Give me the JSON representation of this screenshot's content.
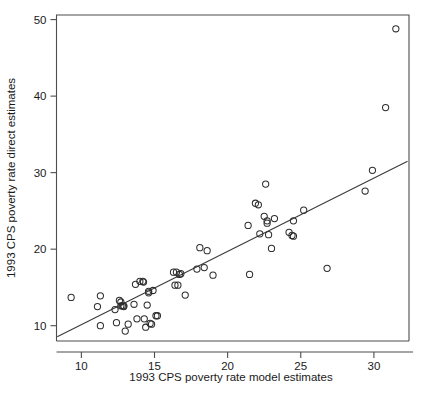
{
  "chart_data": {
    "type": "scatter",
    "title": "",
    "subtitle": "",
    "xlabel": "1993 CPS poverty rate model estimates",
    "ylabel": "1993 CPS poverty rate direct estimates",
    "xlim": [
      8.3,
      32.4
    ],
    "ylim": [
      8.0,
      50.6
    ],
    "xticks": [
      10,
      15,
      20,
      25,
      30
    ],
    "xticklabels": [
      "10",
      "15",
      "20",
      "25",
      "30"
    ],
    "yticks": [
      10,
      20,
      30,
      40,
      50
    ],
    "yticklabels": [
      "10",
      "20",
      "30",
      "40",
      "50"
    ],
    "grid": false,
    "legend": null,
    "marker": "open-circle",
    "marker_size": 4.2,
    "series": [
      {
        "name": "states",
        "x": [
          9.3,
          11.1,
          11.3,
          11.3,
          12.3,
          12.4,
          12.6,
          12.7,
          12.7,
          12.8,
          12.9,
          12.9,
          13.0,
          13.2,
          13.6,
          13.7,
          13.8,
          14.0,
          14.2,
          14.25,
          14.3,
          14.4,
          14.5,
          14.6,
          14.6,
          14.7,
          14.8,
          14.9,
          15.1,
          15.2,
          16.3,
          16.4,
          16.5,
          16.6,
          16.7,
          16.8,
          17.1,
          17.9,
          18.1,
          18.4,
          18.6,
          19.0,
          21.4,
          21.5,
          21.9,
          22.1,
          22.2,
          22.5,
          22.6,
          22.7,
          22.7,
          22.8,
          23.0,
          23.2,
          24.2,
          24.4,
          24.5,
          24.5,
          25.2,
          26.8,
          29.4,
          29.9,
          30.8,
          31.5
        ],
        "y": [
          13.7,
          12.5,
          13.9,
          10.0,
          12.1,
          10.4,
          13.3,
          13.1,
          12.6,
          12.6,
          12.6,
          12.5,
          9.3,
          10.2,
          12.8,
          15.4,
          10.9,
          15.8,
          15.8,
          15.7,
          10.9,
          9.8,
          12.7,
          14.5,
          14.3,
          10.3,
          10.2,
          14.6,
          11.3,
          11.3,
          17.0,
          15.3,
          17.0,
          15.3,
          16.7,
          16.8,
          14.0,
          17.4,
          20.2,
          17.6,
          19.8,
          16.6,
          23.1,
          16.7,
          26.0,
          25.8,
          22.0,
          24.3,
          28.5,
          23.7,
          23.4,
          21.9,
          20.1,
          24.0,
          22.2,
          21.8,
          23.7,
          21.7,
          25.1,
          17.5,
          27.6,
          30.3,
          38.5,
          48.8
        ]
      }
    ],
    "fit_line": {
      "name": "reference-line",
      "x": [
        8.35,
        32.3
      ],
      "y": [
        8.55,
        31.5
      ]
    }
  }
}
